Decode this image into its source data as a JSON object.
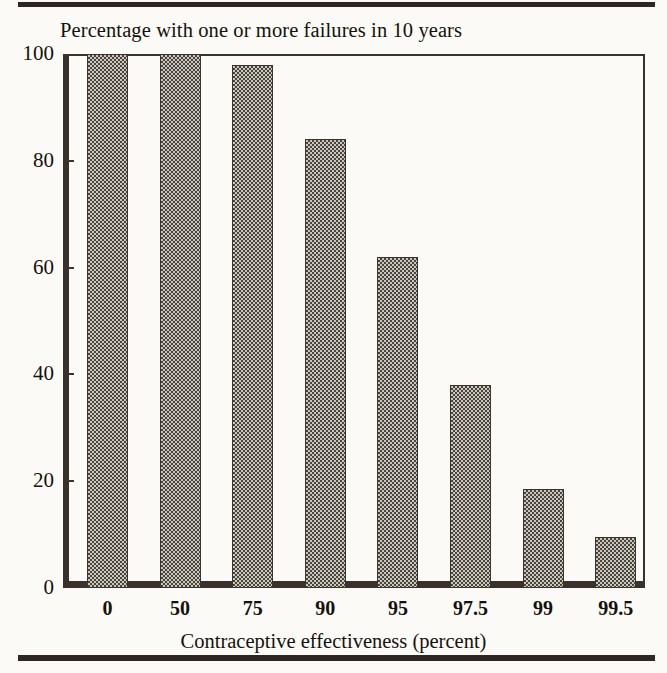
{
  "figure": {
    "background_color": "#fbfaf6",
    "ink_color": "#2e2620",
    "top_rule": "horizontal-rule",
    "bottom_rule": "horizontal-rule"
  },
  "chart_data": {
    "type": "bar",
    "title": "Percentage with one or more failures in 10 years",
    "xlabel": "Contraceptive effectiveness (percent)",
    "ylabel": "",
    "categories": [
      "0",
      "50",
      "75",
      "90",
      "95",
      "97.5",
      "99",
      "99.5"
    ],
    "values": [
      100,
      100,
      98,
      84,
      62,
      38,
      18.5,
      9.5
    ],
    "ylim": [
      0,
      100
    ],
    "yticks": [
      "0",
      "20",
      "40",
      "60",
      "80",
      "100"
    ],
    "ytick_values": [
      0,
      20,
      40,
      60,
      80,
      100
    ],
    "grid": false,
    "legend": "none",
    "bar_fill": "checkerboard-halftone",
    "bar_fill_color": "#4a443c",
    "bar_edge_color": "#3b342c"
  }
}
